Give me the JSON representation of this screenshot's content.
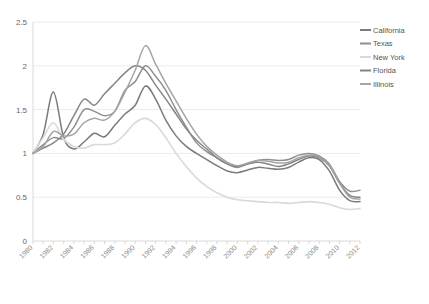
{
  "chart_data": {
    "type": "line",
    "title": "",
    "subtitle": "",
    "xlabel": "",
    "ylabel": "",
    "ylim": [
      0,
      2.5
    ],
    "xlim": [
      1980,
      2012
    ],
    "yticks": [
      "0",
      "0.5",
      "1",
      "1.5",
      "2",
      "2.5"
    ],
    "ytick_values": [
      0,
      0.5,
      1,
      1.5,
      2,
      2.5
    ],
    "grid": true,
    "legend_position": "right",
    "x": [
      1980,
      1981,
      1982,
      1983,
      1984,
      1985,
      1986,
      1987,
      1988,
      1989,
      1990,
      1991,
      1992,
      1993,
      1994,
      1995,
      1996,
      1997,
      1998,
      1999,
      2000,
      2001,
      2002,
      2003,
      2004,
      2005,
      2006,
      2007,
      2008,
      2009,
      2010,
      2011,
      2012
    ],
    "xtick_labels": [
      "1980",
      "1982",
      "1984",
      "1986",
      "1988",
      "1990",
      "1992",
      "1994",
      "1996",
      "1998",
      "2000",
      "2002",
      "2004",
      "2006",
      "2008",
      "2010",
      "2012"
    ],
    "series": [
      {
        "name": "California",
        "color": "#7b7b7b",
        "values": [
          1.0,
          1.22,
          1.7,
          1.18,
          1.05,
          1.13,
          1.23,
          1.19,
          1.32,
          1.45,
          1.55,
          1.77,
          1.62,
          1.38,
          1.2,
          1.08,
          1.0,
          0.93,
          0.86,
          0.8,
          0.78,
          0.81,
          0.84,
          0.83,
          0.82,
          0.84,
          0.9,
          0.95,
          0.93,
          0.8,
          0.58,
          0.46,
          0.45
        ]
      },
      {
        "name": "Texas",
        "color": "#8f8f8f",
        "values": [
          1.0,
          1.1,
          1.18,
          1.17,
          1.3,
          1.5,
          1.48,
          1.43,
          1.48,
          1.72,
          1.82,
          2.0,
          1.88,
          1.72,
          1.5,
          1.3,
          1.12,
          1.02,
          0.95,
          0.88,
          0.84,
          0.88,
          0.92,
          0.93,
          0.92,
          0.93,
          0.98,
          1.0,
          0.97,
          0.88,
          0.68,
          0.57,
          0.58
        ]
      },
      {
        "name": "New York",
        "color": "#d9d9d9",
        "values": [
          1.0,
          1.18,
          1.35,
          1.16,
          1.08,
          1.06,
          1.1,
          1.1,
          1.12,
          1.22,
          1.35,
          1.4,
          1.33,
          1.18,
          1.0,
          0.85,
          0.72,
          0.62,
          0.55,
          0.5,
          0.47,
          0.46,
          0.45,
          0.44,
          0.44,
          0.43,
          0.44,
          0.45,
          0.44,
          0.42,
          0.38,
          0.36,
          0.37
        ]
      },
      {
        "name": "Florida",
        "color": "#858585",
        "values": [
          1.0,
          1.06,
          1.12,
          1.22,
          1.43,
          1.62,
          1.55,
          1.68,
          1.8,
          1.92,
          2.0,
          1.95,
          1.78,
          1.62,
          1.45,
          1.28,
          1.15,
          1.05,
          0.95,
          0.88,
          0.85,
          0.88,
          0.9,
          0.88,
          0.85,
          0.88,
          0.93,
          0.97,
          0.95,
          0.86,
          0.66,
          0.52,
          0.5
        ]
      },
      {
        "name": "Illinois",
        "color": "#a5a5a5",
        "values": [
          1.0,
          1.08,
          1.25,
          1.2,
          1.22,
          1.35,
          1.4,
          1.38,
          1.48,
          1.7,
          1.95,
          2.23,
          2.02,
          1.8,
          1.6,
          1.4,
          1.22,
          1.08,
          0.98,
          0.9,
          0.86,
          0.89,
          0.92,
          0.91,
          0.89,
          0.9,
          0.95,
          0.98,
          0.96,
          0.87,
          0.66,
          0.5,
          0.48
        ]
      }
    ]
  },
  "legend": {
    "items": [
      {
        "label": "California"
      },
      {
        "label": "Texas"
      },
      {
        "label": "New York"
      },
      {
        "label": "Florida"
      },
      {
        "label": "Illinois"
      }
    ]
  }
}
